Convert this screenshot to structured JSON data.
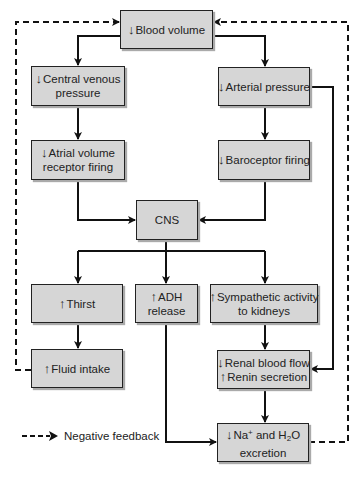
{
  "diagram": {
    "boxes": {
      "blood_volume": {
        "arrow": "↓",
        "lines": [
          "Blood volume"
        ]
      },
      "central_venous": {
        "arrow": "↓",
        "lines": [
          "Central venous",
          "pressure"
        ]
      },
      "arterial": {
        "arrow": "↓",
        "lines": [
          "Arterial pressure"
        ]
      },
      "atrial": {
        "arrow": "↓",
        "lines": [
          "Atrial volume",
          "receptor firing"
        ]
      },
      "baroceptor": {
        "arrow": "↓",
        "lines": [
          "Baroceptor firing"
        ]
      },
      "cns": {
        "lines": [
          "CNS"
        ]
      },
      "thirst": {
        "arrow": "↑",
        "lines": [
          "Thirst"
        ]
      },
      "adh": {
        "arrow": "↑",
        "lines": [
          "ADH",
          "release"
        ]
      },
      "sympathetic": {
        "arrow": "↑",
        "lines": [
          "Sympathetic activity",
          "to kidneys"
        ]
      },
      "fluid_intake": {
        "arrow": "↑",
        "lines": [
          "Fluid intake"
        ]
      },
      "renal": {
        "arrow1": "↓",
        "line1": "Renal blood flow",
        "arrow2": "↑",
        "line2": "Renin secretion"
      },
      "na_excretion": {
        "arrow": "↓",
        "na": "Na",
        "plus": "+",
        "and": " and H",
        "two": "2",
        "o": "O",
        "line2": "excretion"
      }
    },
    "legend": {
      "label": "Negative feedback"
    },
    "colors": {
      "box_fill": "#d6d6d6",
      "line": "#111111"
    }
  }
}
